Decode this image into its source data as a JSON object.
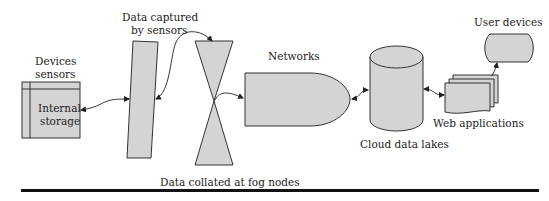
{
  "diagram": {
    "labels": {
      "devices_line1": "Devices",
      "devices_line2": "sensors",
      "internal_line1": "Internal",
      "internal_line2": "storage",
      "captured_line1": "Data captured",
      "captured_line2": "by sensors",
      "networks": "Networks",
      "cloud": "Cloud data lakes",
      "web_apps": "Web applications",
      "user_devices": "User devices",
      "fog": "Data collated at fog nodes"
    },
    "colors": {
      "fill": "#d4d4d4",
      "stroke": "#333333",
      "text": "#222222",
      "rule": "#111111"
    }
  }
}
